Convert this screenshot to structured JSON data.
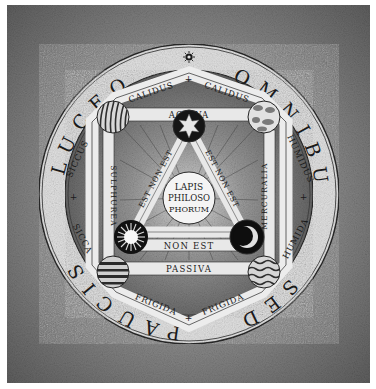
{
  "diagram": {
    "type": "alchemical-emblem",
    "outer_ring_text": {
      "left_top": "LUCEO",
      "right_top": "OMNIBUS",
      "right_bottom": "SED",
      "left_bottom": "PAUCIS",
      "top_symbol": "sun-sigil"
    },
    "pentagon": {
      "upper_left_edge": "CALIDUS",
      "upper_right_edge": "CALIDUS",
      "left_upper_edge": "SICCUS",
      "left_lower_edge": "SICCA",
      "right_upper_edge": "HUMIDUS",
      "right_lower_edge": "HUMIDA",
      "lower_left_edge": "FRIGIDA",
      "lower_right_edge": "FRIGIDA",
      "cross_glyph": "+"
    },
    "inner_frame": {
      "top_band": "ACTIVA",
      "bottom_band": "PASSIVA",
      "left_column": "SULPHUREA",
      "right_column": "MERCURALIA",
      "middle_band": "NON EST"
    },
    "triangle": {
      "left_side": "EST NON EST",
      "right_side": "EST NON EST",
      "apex_label": "EST",
      "left_corner_label": "EST",
      "right_corner_label": "EST"
    },
    "center": {
      "lines": [
        "LAPIS",
        "PHILOSO",
        "PHORUM"
      ]
    },
    "symbols": {
      "apex": "six-pointed-star",
      "left_corner": "sun",
      "right_corner": "crescent-moon"
    },
    "elements": {
      "upper_left": "fire",
      "upper_right": "air",
      "lower_left": "earth",
      "lower_right": "water"
    },
    "colors": {
      "background_dark": "#6e6e6e",
      "background_light": "#a8a8a8",
      "parchment": "#e4e4e4",
      "ink": "#1a1a1a",
      "band_shadow": "#5a5a5a",
      "page_margin": "#ffffff"
    }
  }
}
